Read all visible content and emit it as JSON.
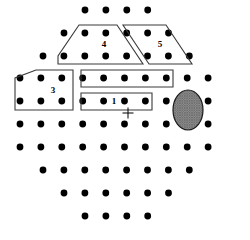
{
  "figure": {
    "width": 250,
    "height": 240,
    "background_color": "#ffffff",
    "dot_color": "#000000",
    "outline_color": "#3a3a3a",
    "dot_radius": 3.4
  },
  "grid": {
    "x_origin": 20,
    "x_step": 20.9,
    "y_origin": 10,
    "y_step": 22.8,
    "description": "Offset lattice; odd rows shifted half a step",
    "rows": [
      {
        "index": 0,
        "y": 10,
        "x_start": 85,
        "count": 4
      },
      {
        "index": 1,
        "y": 33,
        "x_start": 64,
        "count": 6
      },
      {
        "index": 2,
        "y": 56,
        "x_start": 43,
        "count": 8
      },
      {
        "index": 3,
        "y": 78,
        "x_start": 20,
        "count": 10
      },
      {
        "index": 4,
        "y": 101,
        "x_start": 20,
        "count": 10
      },
      {
        "index": 5,
        "y": 124,
        "x_start": 20,
        "count": 10
      },
      {
        "index": 6,
        "y": 147,
        "x_start": 20,
        "count": 10
      },
      {
        "index": 7,
        "y": 170,
        "x_start": 43,
        "count": 8
      },
      {
        "index": 8,
        "y": 193,
        "x_start": 64,
        "count": 6
      },
      {
        "index": 9,
        "y": 216,
        "x_start": 85,
        "count": 4
      }
    ]
  },
  "regions": [
    {
      "id": "region-1",
      "label": "1",
      "shape": "rectangle",
      "dot_count": 3,
      "label_x": 114,
      "label_y": 102,
      "points": "81,93 152,93 152,110 81,110"
    },
    {
      "id": "region-2",
      "label": "2",
      "shape": "rectangle",
      "dot_count": 4,
      "label_x": 125,
      "label_y": 79,
      "points": "81,70 173,70 173,87 81,87"
    },
    {
      "id": "region-3",
      "label": "3",
      "shape": "trapezoid",
      "dot_count": 6,
      "label_x": 53,
      "label_y": 91,
      "points": "15,94 15,78 36,70 73,70 73,110 15,110"
    },
    {
      "id": "region-4",
      "label": "4",
      "shape": "trapezoid",
      "dot_count": 7,
      "label_x": 104,
      "label_y": 45,
      "points": "58,64 58,56 79,25 117,25 143,64"
    },
    {
      "id": "region-5",
      "label": "5",
      "shape": "parallelogram",
      "dot_count": 6,
      "label_x": 160,
      "label_y": 45,
      "points": "123,25 166,25 192,64 149,64"
    }
  ],
  "markers": [
    {
      "id": "crosshair",
      "type": "plus",
      "x": 128,
      "y": 113,
      "size": 11,
      "color": "#000000"
    },
    {
      "id": "hatched-blob",
      "type": "ellipse",
      "cx": 188,
      "cy": 110,
      "rx": 15,
      "ry": 20,
      "fill": "hatched-gray",
      "color": "#808080"
    }
  ]
}
